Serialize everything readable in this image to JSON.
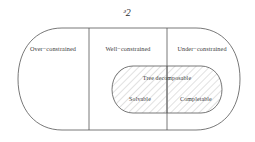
{
  "title": {
    "text": "ᵊ2",
    "fallback": "G",
    "description": "script capital G denoting the universe of constraint graphs"
  },
  "colors": {
    "stroke": "#555555",
    "hatch": "#a8a8a8",
    "text": "#3a3a3a",
    "background": "#ffffff"
  },
  "outer_regions": [
    {
      "id": "over-constrained",
      "label": "Over−constrained"
    },
    {
      "id": "well-constrained",
      "label": "Well−constrained"
    },
    {
      "id": "under-constrained",
      "label": "Under−constrained"
    }
  ],
  "inner_region": {
    "heading": "Tree decomposable",
    "subregions": [
      {
        "id": "solvable",
        "label": "Solvable"
      },
      {
        "id": "completable",
        "label": "Completable"
      }
    ]
  },
  "geometry": {
    "outer_left": 18,
    "outer_right": 240,
    "outer_top": 28,
    "outer_bottom": 130,
    "divider_1_x": 89,
    "divider_2_x": 167,
    "inner_left": 112,
    "inner_right": 222,
    "inner_top": 66,
    "inner_bottom": 113,
    "hatch_angle_deg": 45,
    "hatch_spacing_px": 5
  }
}
